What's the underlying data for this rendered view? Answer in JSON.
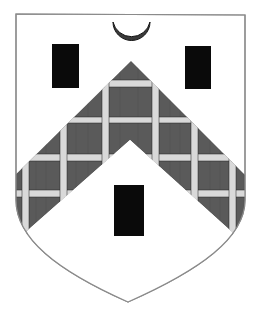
{
  "image": {
    "description": "Heraldic coat of arms: argent, a chevron fretty, between three billets sable, a crescent in chief",
    "field_color": "#ffffff",
    "outline_color": "#8a8a8a"
  },
  "charges": {
    "crescent": {
      "label": "crescent",
      "color": "#3a3a3a",
      "cx": 131,
      "cy": 34,
      "r": 18
    },
    "billets": [
      {
        "label": "billet-dexter-chief",
        "x": 52,
        "y": 44,
        "w": 27,
        "h": 44,
        "color": "#0a0a0a"
      },
      {
        "label": "billet-sinister-chief",
        "x": 185,
        "y": 46,
        "w": 26,
        "h": 43,
        "color": "#0a0a0a"
      },
      {
        "label": "billet-base",
        "x": 114,
        "y": 185,
        "w": 30,
        "h": 51,
        "color": "#0a0a0a"
      }
    ]
  },
  "ordinary": {
    "label": "chevron-fretty",
    "fill_color": "#5a5a5a",
    "fret_color": "#d9d9d9"
  }
}
